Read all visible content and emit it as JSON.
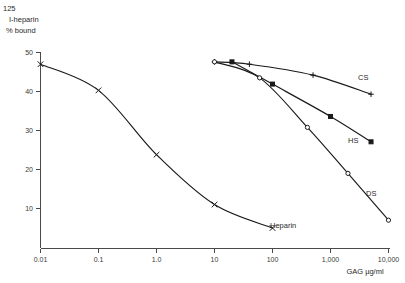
{
  "chart_data": {
    "type": "line",
    "title": "",
    "xlabel": "GAG µg/ml",
    "ylabel_lines": [
      "125",
      "I-heparin",
      "% bound"
    ],
    "ylabel_isotope": "125",
    "ylabel_main": "I-heparin",
    "ylabel_sub": "% bound",
    "xscale": "log",
    "xlim": [
      0.01,
      10000
    ],
    "ylim": [
      0,
      50
    ],
    "grid": false,
    "legend_position": "inline-right",
    "xticks": [
      0.01,
      0.1,
      1.0,
      10,
      100,
      1000,
      10000
    ],
    "xticklabels": [
      "0.01",
      "0.1",
      "1.0",
      "10",
      "100",
      "1,000",
      "10,000"
    ],
    "yticks": [
      10,
      20,
      30,
      40,
      50
    ],
    "yticklabels": [
      "10",
      "20",
      "30",
      "40",
      "50"
    ],
    "series": [
      {
        "name": "Heparin",
        "label": "Heparin",
        "marker": "x",
        "marker_style": "cross-x",
        "points": [
          {
            "x": 0.01,
            "y": 47.0
          },
          {
            "x": 0.1,
            "y": 40.3
          },
          {
            "x": 1.0,
            "y": 23.8
          },
          {
            "x": 10,
            "y": 11.0
          },
          {
            "x": 100,
            "y": 5.0
          }
        ]
      },
      {
        "name": "CS",
        "label": "CS",
        "marker": "+",
        "marker_style": "plus",
        "points": [
          {
            "x": 10,
            "y": 47.6
          },
          {
            "x": 40,
            "y": 47.0
          },
          {
            "x": 500,
            "y": 44.2
          },
          {
            "x": 5000,
            "y": 39.3
          }
        ]
      },
      {
        "name": "HS",
        "label": "HS",
        "marker": "filled-square",
        "marker_style": "filled",
        "points": [
          {
            "x": 20,
            "y": 47.6
          },
          {
            "x": 100,
            "y": 41.9
          },
          {
            "x": 1000,
            "y": 33.6
          },
          {
            "x": 5000,
            "y": 27.1
          }
        ]
      },
      {
        "name": "DS",
        "label": "DS",
        "marker": "open-circle",
        "marker_style": "open",
        "points": [
          {
            "x": 10,
            "y": 47.6
          },
          {
            "x": 60,
            "y": 43.5
          },
          {
            "x": 400,
            "y": 30.8
          },
          {
            "x": 2000,
            "y": 19.0
          },
          {
            "x": 10000,
            "y": 7.0
          }
        ]
      }
    ]
  },
  "axis": {
    "x_caption": "GAG µg/ml"
  },
  "series_labels": {
    "cs": "CS",
    "hs": "HS",
    "ds": "DS",
    "heparin": "Heparin"
  },
  "xticklabels": {
    "t0": "0.01",
    "t1": "0.1",
    "t2": "1.0",
    "t3": "10",
    "t4": "100",
    "t5": "1,000",
    "t6": "10,000"
  },
  "yticklabels": {
    "t10": "10",
    "t20": "20",
    "t30": "30",
    "t40": "40",
    "t50": "50"
  },
  "ylabel": {
    "isotope": "125",
    "main": "I-heparin",
    "sub": "% bound"
  },
  "colors": {
    "ink": "#1a1a1a",
    "axis": "#4a4a4a",
    "background": "#ffffff"
  }
}
